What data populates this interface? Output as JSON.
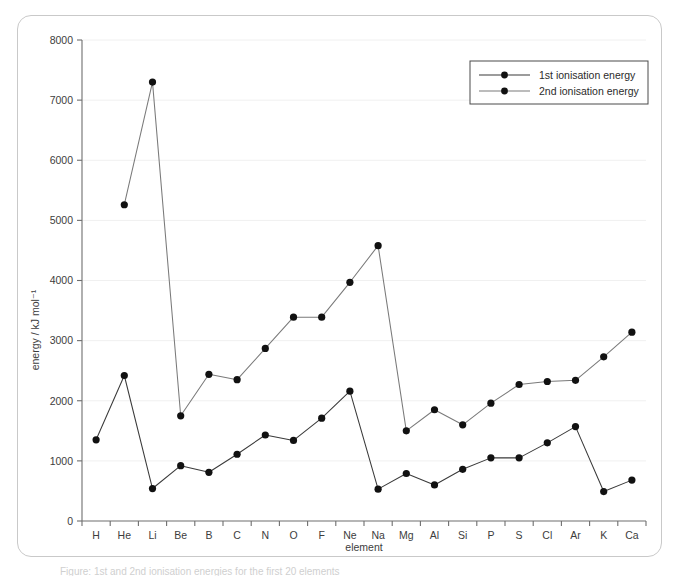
{
  "figure": {
    "caption": "Figure: 1st and 2nd ionisation energies for the first 20 elements"
  },
  "chart_data": {
    "type": "line",
    "title": "",
    "xlabel": "element",
    "ylabel": "energy / kJ mol⁻¹",
    "ylim": [
      0,
      8000
    ],
    "ytick_labels": [
      "0",
      "1000",
      "2000",
      "3000",
      "4000",
      "5000",
      "6000",
      "7000",
      "8000"
    ],
    "ytick_values": [
      0,
      1000,
      2000,
      3000,
      4000,
      5000,
      6000,
      7000,
      8000
    ],
    "grid": true,
    "legend_position": "top-right",
    "categories": [
      "H",
      "He",
      "Li",
      "Be",
      "B",
      "C",
      "N",
      "O",
      "F",
      "Ne",
      "Na",
      "Mg",
      "Al",
      "Si",
      "P",
      "S",
      "Cl",
      "Ar",
      "K",
      "Ca"
    ],
    "series": [
      {
        "name": "1st ionisation energy",
        "marker": "circle",
        "values": [
          1350,
          2420,
          540,
          920,
          810,
          1110,
          1430,
          1340,
          1710,
          2160,
          530,
          790,
          600,
          860,
          1050,
          1050,
          1300,
          1570,
          490,
          680
        ]
      },
      {
        "name": "2nd ionisation energy",
        "marker": "circle",
        "values": [
          null,
          5260,
          7300,
          1750,
          2440,
          2350,
          2870,
          3390,
          3390,
          3970,
          4580,
          1500,
          1850,
          1600,
          1960,
          2270,
          2320,
          2340,
          2730,
          3140
        ]
      }
    ],
    "second_series_note": "2nd ionisation energy values plotted from He onward; H has no 2nd ionisation energy shown",
    "second_series_display": [
      1350,
      5260,
      7300,
      1750,
      2440,
      2350,
      2870,
      3390,
      3390,
      3970,
      4580,
      1500,
      1850,
      1600,
      1960,
      2270,
      2320,
      2340,
      2730,
      3140
    ]
  },
  "legend": {
    "items": [
      {
        "label": "1st ionisation energy"
      },
      {
        "label": "2nd ionisation energy"
      }
    ]
  },
  "colors": {
    "series1": "#3a3a3a",
    "series2": "#7a7a7a",
    "marker": "#111111",
    "axis": "#6e6e6e",
    "grid": "#f0f0f0",
    "frame": "#c9c9c9"
  }
}
